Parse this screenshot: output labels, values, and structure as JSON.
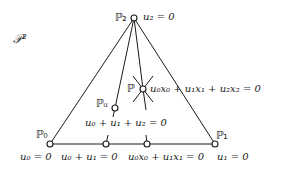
{
  "diagram": {
    "space_label": "𝒫²",
    "points": {
      "P0": {
        "label": "ℙ₀",
        "x": 50,
        "y": 144,
        "equation": "u₀ = 0"
      },
      "P1": {
        "label": "ℙ₁",
        "x": 215,
        "y": 144,
        "equation": "u₁ = 0"
      },
      "P2": {
        "label": "ℙ₂",
        "x": 134,
        "y": 18,
        "equation": "u₂ = 0"
      },
      "P": {
        "label": "ℙ",
        "x": 143,
        "y": 89,
        "equation": "u₀x₀ + u₁x₁ + u₂x₂ = 0"
      },
      "Pu": {
        "label": "ℙᵤ",
        "x": 115,
        "y": 108,
        "equation": "u₀ + u₁ + u₂ = 0"
      },
      "Q1": {
        "x": 106,
        "y": 144,
        "equation": "u₀ + u₁ = 0"
      },
      "Q2": {
        "x": 147,
        "y": 144,
        "equation": "u₀x₀ + u₁x₁ = 0"
      }
    },
    "labels": {
      "p2_eq": "u₂ = 0",
      "p_eq": "u₀x₀ + u₁x₁ + u₂x₂ = 0",
      "pu_eq": "u₀ + u₁ + u₂ = 0",
      "p0_eq": "u₀ = 0",
      "q1_eq": "u₀ + u₁ = 0",
      "q2_eq": "u₀x₀ + u₁x₁ = 0",
      "p1_eq": "u₁ = 0"
    },
    "colors": {
      "stroke": "#1a1a1a",
      "background": "#ffffff"
    }
  }
}
